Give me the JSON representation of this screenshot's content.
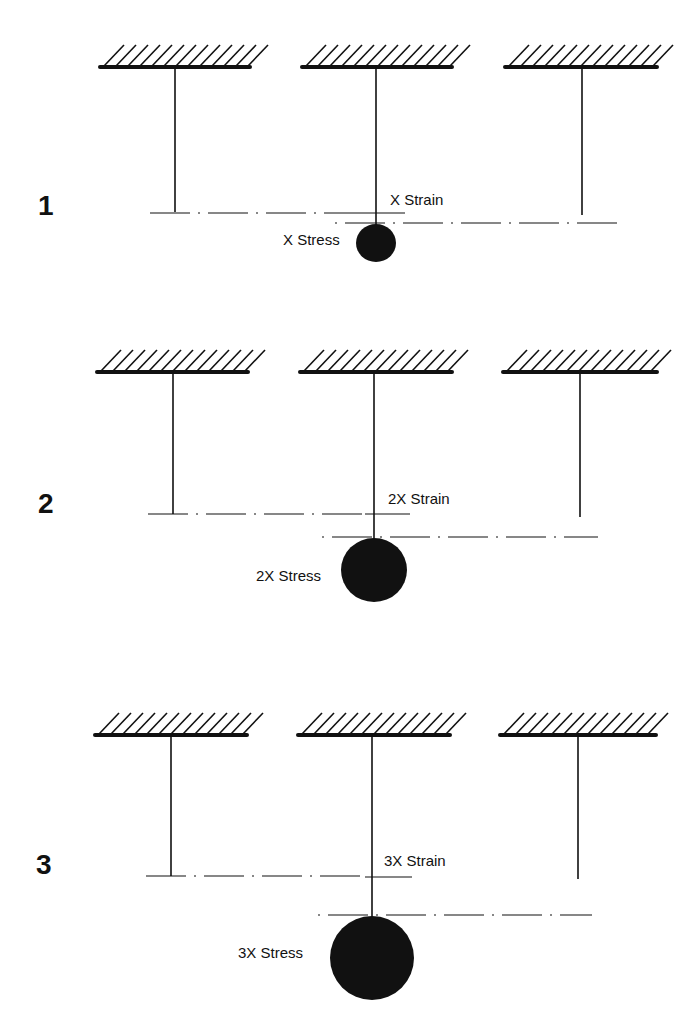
{
  "diagram": {
    "type": "stress-strain-hanging-rods",
    "colors": {
      "ink": "#111111",
      "background": "#ffffff"
    },
    "panels": [
      {
        "number": "1",
        "strain_label": "X Strain",
        "stress_label": "X Stress",
        "ceiling_y": 67,
        "ceilings": [
          [
            100,
            250
          ],
          [
            302,
            452
          ],
          [
            505,
            657
          ]
        ],
        "rods": [
          {
            "x": 175,
            "bottom": 212
          },
          {
            "x": 376,
            "bottom": 228
          },
          {
            "x": 582,
            "bottom": 215
          }
        ],
        "ref_line": {
          "y": 213,
          "x1": 150,
          "x2": 360
        },
        "strain_tick": {
          "y": 213,
          "x1": 360,
          "x2": 405
        },
        "stretched_line": {
          "y": 223,
          "x1": 335,
          "x2": 625
        },
        "weight": {
          "cx": 376,
          "cy": 243,
          "rx": 20,
          "ry": 19
        },
        "number_pos": [
          38,
          215
        ],
        "strain_pos": [
          390,
          205
        ],
        "stress_pos": [
          283,
          245
        ]
      },
      {
        "number": "2",
        "strain_label": "2X Strain",
        "stress_label": "2X Stress",
        "ceiling_y": 372,
        "ceilings": [
          [
            97,
            248
          ],
          [
            300,
            452
          ],
          [
            503,
            657
          ]
        ],
        "rods": [
          {
            "x": 173,
            "bottom": 514
          },
          {
            "x": 374,
            "bottom": 540
          },
          {
            "x": 580,
            "bottom": 517
          }
        ],
        "ref_line": {
          "y": 514,
          "x1": 148,
          "x2": 365
        },
        "strain_tick": {
          "y": 514,
          "x1": 365,
          "x2": 410
        },
        "stretched_line": {
          "y": 537,
          "x1": 322,
          "x2": 598
        },
        "weight": {
          "cx": 374,
          "cy": 570,
          "rx": 33,
          "ry": 32
        },
        "number_pos": [
          38,
          513
        ],
        "strain_pos": [
          388,
          504
        ],
        "stress_pos": [
          256,
          581
        ]
      },
      {
        "number": "3",
        "strain_label": "3X Strain",
        "stress_label": "3X Stress",
        "ceiling_y": 735,
        "ceilings": [
          [
            95,
            247
          ],
          [
            298,
            450
          ],
          [
            500,
            656
          ]
        ],
        "rods": [
          {
            "x": 171,
            "bottom": 876
          },
          {
            "x": 372,
            "bottom": 917
          },
          {
            "x": 578,
            "bottom": 879
          }
        ],
        "ref_line": {
          "y": 876,
          "x1": 146,
          "x2": 365
        },
        "strain_tick": {
          "y": 877,
          "x1": 365,
          "x2": 412
        },
        "stretched_line": {
          "y": 915,
          "x1": 318,
          "x2": 592
        },
        "weight": {
          "cx": 372,
          "cy": 958,
          "rx": 42,
          "ry": 42
        },
        "number_pos": [
          36,
          874
        ],
        "strain_pos": [
          384,
          866
        ],
        "stress_pos": [
          238,
          958
        ]
      }
    ]
  }
}
